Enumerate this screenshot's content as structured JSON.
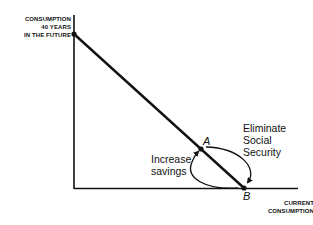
{
  "diagram": {
    "y_axis_label": [
      "CONSUMPTION",
      "40 YEARS",
      "IN THE FUTURE"
    ],
    "x_axis_label": [
      "CURRENT",
      "CONSUMPTION"
    ],
    "points": {
      "a": "A",
      "b": "B"
    },
    "annotations": {
      "increase_savings": [
        "Increase",
        "savings"
      ],
      "eliminate_social_security": [
        "Eliminate",
        "Social",
        "Security"
      ]
    },
    "colors": {
      "line": "#111111",
      "background": "#ffffff"
    }
  }
}
